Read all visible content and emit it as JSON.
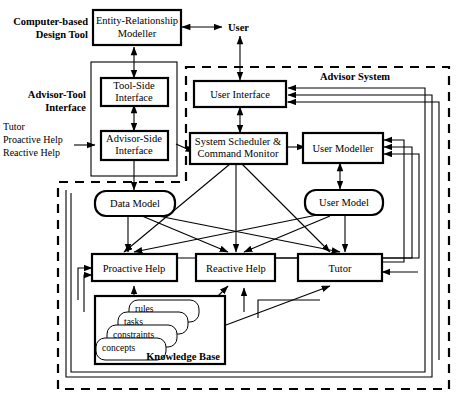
{
  "diagram": {
    "regions": [
      {
        "id": "computer_based_design_tool",
        "label_line1": "Computer-based",
        "label_line2": "Design Tool",
        "style": "label-only"
      },
      {
        "id": "advisor_tool_interface",
        "label_line1": "Advisor-Tool",
        "label_line2": "Interface",
        "style": "solid"
      },
      {
        "id": "advisor_system",
        "label": "Advisor System",
        "style": "dashed"
      },
      {
        "id": "knowledge_base",
        "label": "Knowledge Base",
        "style": "solid"
      }
    ],
    "nodes": [
      {
        "id": "er_modeller",
        "label_line1": "Entity-Relationship",
        "label_line2": "Modeller",
        "shape": "rect"
      },
      {
        "id": "user",
        "label": "User",
        "shape": "text"
      },
      {
        "id": "tool_side_interface",
        "label_line1": "Tool-Side",
        "label_line2": "Interface",
        "shape": "rect"
      },
      {
        "id": "advisor_side_interface",
        "label_line1": "Advisor-Side",
        "label_line2": "Interface",
        "shape": "rect"
      },
      {
        "id": "user_interface",
        "label": "User Interface",
        "shape": "rect"
      },
      {
        "id": "system_scheduler",
        "label_line1": "System Scheduler &",
        "label_line2": "Command Monitor",
        "shape": "rect"
      },
      {
        "id": "user_modeller",
        "label": "User Modeller",
        "shape": "rect"
      },
      {
        "id": "data_model",
        "label": "Data Model",
        "shape": "rounded"
      },
      {
        "id": "user_model",
        "label": "User Model",
        "shape": "rounded"
      },
      {
        "id": "proactive_help",
        "label": "Proactive Help",
        "shape": "rect"
      },
      {
        "id": "reactive_help",
        "label": "Reactive Help",
        "shape": "rect"
      },
      {
        "id": "tutor",
        "label": "Tutor",
        "shape": "rect"
      },
      {
        "id": "kb_rules",
        "label": "rules",
        "shape": "rounded"
      },
      {
        "id": "kb_tasks",
        "label": "tasks",
        "shape": "rounded"
      },
      {
        "id": "kb_constraints",
        "label": "constraints",
        "shape": "rounded"
      },
      {
        "id": "kb_concepts",
        "label": "concepts",
        "shape": "rounded"
      }
    ],
    "annotations": [
      {
        "id": "incoming_help_label",
        "line1": "Tutor",
        "line2": "Proactive Help",
        "line3": "Reactive Help"
      }
    ],
    "colors": {
      "line": "#000000",
      "background": "#ffffff",
      "text": "#000000"
    }
  }
}
